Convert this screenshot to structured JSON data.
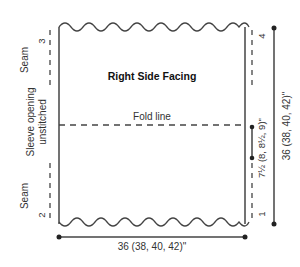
{
  "diagram": {
    "panel_title": "Right Side Facing",
    "fold_label": "Fold line",
    "left_labels": {
      "top_seam": "Seam",
      "sleeve_opening_line1": "Sleeve opening",
      "sleeve_opening_line2": "unstitched",
      "bottom_seam": "Seam"
    },
    "corner_numbers": {
      "top_left": "3",
      "top_right": "4",
      "bottom_left": "2",
      "bottom_right": "1"
    },
    "dimensions": {
      "width": "36 (38, 40, 42)\"",
      "height": "36 (38, 40, 42)\"",
      "fold_offset": "7½ (8, 8½, 9)\""
    },
    "colors": {
      "line": "#444444",
      "text": "#333333",
      "background": "#ffffff"
    }
  }
}
